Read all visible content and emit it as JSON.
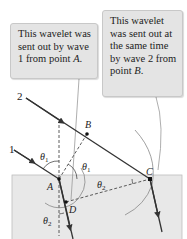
{
  "callouts": [
    {
      "id": "wavelet-a",
      "text_before": "This wavelet was sent out by wave 1 from point ",
      "point": "A",
      "text_after": "."
    },
    {
      "id": "wavelet-b",
      "text_before": "This wavelet was sent out at the same time by wave 2 from point ",
      "point": "B",
      "text_after": "."
    }
  ],
  "labels": {
    "ray1": "1",
    "ray2": "2",
    "point_a": "A",
    "point_b": "B",
    "point_c": "C",
    "point_d": "D",
    "theta1": "θ",
    "theta1_sub": "1",
    "theta2": "θ",
    "theta2_sub": "2"
  },
  "colors": {
    "glass": "#e8e8e8",
    "glass_edge": "#bdbdbd",
    "ray": "#333333",
    "wavelet": "#888888",
    "callout_bg": "#e4e4e4"
  }
}
